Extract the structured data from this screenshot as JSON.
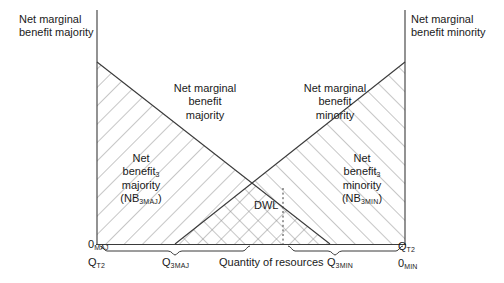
{
  "figure": {
    "type": "economics-diagram"
  },
  "outer_labels": {
    "left": {
      "line1": "Net marginal",
      "line2": "benefit majority"
    },
    "right": {
      "line1": "Net marginal",
      "line2": "benefit minority"
    }
  },
  "curve_labels": {
    "majority": {
      "line1": "Net marginal",
      "line2": "benefit",
      "line3": "majority"
    },
    "minority": {
      "line1": "Net marginal",
      "line2": "benefit",
      "line3": "minority"
    }
  },
  "area_labels": {
    "majority": {
      "line1": "Net",
      "line2_base": "benefit",
      "line2_sub": "3",
      "line3": "majority",
      "line4_open": "(NB",
      "line4_sub": "3MAJ",
      "line4_close": ")"
    },
    "minority": {
      "line1": "Net",
      "line2_base": "benefit",
      "line2_sub": "3",
      "line3": "minority",
      "line4_open": "(NB",
      "line4_sub": "3MIN",
      "line4_close": ")"
    }
  },
  "dwl": {
    "label": "DWL"
  },
  "axis": {
    "x_title": "Quantity of resources",
    "origin_left": {
      "base": "0",
      "sub": "MAJ"
    },
    "origin_right": {
      "base": "0",
      "sub": "MIN"
    },
    "q_left_total": {
      "base": "Q",
      "sub": "T2"
    },
    "q_right_total": {
      "base": "Q",
      "sub": "T2"
    },
    "q_left_three": {
      "base": "Q",
      "sub": "3MAJ"
    },
    "q_right_three": {
      "base": "Q",
      "sub": "3MIN"
    }
  },
  "colors": {
    "line": "#3a3a3a",
    "hatch": "#8d8d8d",
    "text": "#1a1a1a",
    "background": "#ffffff"
  }
}
